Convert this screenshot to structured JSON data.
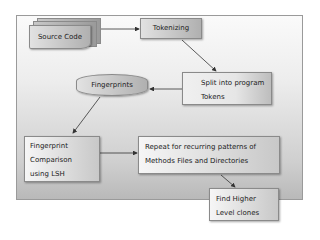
{
  "diagram": {
    "nodes": [
      {
        "id": "source-code",
        "label": "Source Code",
        "shape": "multi-document"
      },
      {
        "id": "tokenizing",
        "label": "Tokenizing",
        "shape": "rectangle"
      },
      {
        "id": "split",
        "label_lines": [
          "Split into program",
          "Tokens"
        ],
        "shape": "rectangle"
      },
      {
        "id": "fingerprints",
        "label": "Fingerprints",
        "shape": "cylinder"
      },
      {
        "id": "comparison",
        "label_lines": [
          "Fingerprint",
          "Comparison",
          "using LSH"
        ],
        "shape": "rectangle"
      },
      {
        "id": "repeat",
        "label_lines": [
          "Repeat for recurring patterns of",
          "Methods Files and Directories"
        ],
        "shape": "rectangle"
      },
      {
        "id": "find",
        "label_lines": [
          "Find Higher",
          "Level clones"
        ],
        "shape": "rectangle"
      }
    ],
    "edges": [
      {
        "from": "source-code",
        "to": "tokenizing"
      },
      {
        "from": "tokenizing",
        "to": "split"
      },
      {
        "from": "split",
        "to": "fingerprints"
      },
      {
        "from": "fingerprints",
        "to": "comparison"
      },
      {
        "from": "comparison",
        "to": "repeat"
      },
      {
        "from": "repeat",
        "to": "find"
      }
    ],
    "colors": {
      "node_fill": "#bdbdbd",
      "border": "#8a8a8a",
      "arrow": "#333333",
      "text": "#222222"
    }
  }
}
